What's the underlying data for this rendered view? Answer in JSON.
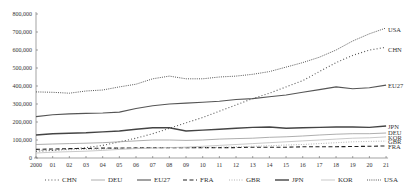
{
  "chart_data": {
    "type": "line",
    "title": "",
    "xlabel": "",
    "ylabel": "",
    "ylim": [
      0,
      800000
    ],
    "yticks": [
      0,
      100000,
      200000,
      300000,
      400000,
      500000,
      600000,
      700000,
      800000
    ],
    "ytick_labels": [
      "0",
      "100,000",
      "200,000",
      "300,000",
      "400,000",
      "500,000",
      "600,000",
      "700,000",
      "800,000"
    ],
    "x_tick_labels": [
      "2000",
      "01",
      "02",
      "03",
      "04",
      "05",
      "06",
      "07",
      "08",
      "09",
      "10",
      "11",
      "12",
      "13",
      "14",
      "15",
      "16",
      "17",
      "18",
      "19",
      "20",
      "21"
    ],
    "x": [
      2000,
      2001,
      2002,
      2003,
      2004,
      2005,
      2006,
      2007,
      2008,
      2009,
      2010,
      2011,
      2012,
      2013,
      2014,
      2015,
      2016,
      2017,
      2018,
      2019,
      2020,
      2021
    ],
    "grid": false,
    "legend_position": "bottom",
    "series": [
      {
        "name": "CHN",
        "style": "dotted",
        "color": "#555555",
        "values": [
          38000,
          42000,
          50000,
          58000,
          70000,
          90000,
          110000,
          135000,
          165000,
          195000,
          225000,
          260000,
          295000,
          330000,
          360000,
          395000,
          430000,
          480000,
          530000,
          570000,
          600000,
          615000
        ]
      },
      {
        "name": "DEU",
        "style": "solid-thin",
        "color": "#999999",
        "values": [
          75000,
          78000,
          80000,
          82000,
          85000,
          90000,
          95000,
          100000,
          100000,
          98000,
          100000,
          105000,
          108000,
          110000,
          115000,
          118000,
          122000,
          128000,
          132000,
          135000,
          135000,
          139000
        ]
      },
      {
        "name": "EU27",
        "style": "solid",
        "color": "#555555",
        "values": [
          230000,
          240000,
          245000,
          248000,
          250000,
          255000,
          275000,
          290000,
          300000,
          305000,
          310000,
          315000,
          325000,
          330000,
          340000,
          350000,
          365000,
          380000,
          395000,
          385000,
          390000,
          405000
        ]
      },
      {
        "name": "FRA",
        "style": "dashed",
        "color": "#222222",
        "values": [
          48000,
          50000,
          52000,
          53000,
          55000,
          55000,
          56000,
          58000,
          58000,
          57000,
          58000,
          58000,
          58000,
          60000,
          60000,
          60000,
          62000,
          62000,
          63000,
          64000,
          65000,
          67000
        ]
      },
      {
        "name": "GBR",
        "style": "dotted-light",
        "color": "#aaaaaa",
        "values": [
          42000,
          44000,
          46000,
          48000,
          50000,
          55000,
          55000,
          58000,
          58000,
          56000,
          58000,
          60000,
          62000,
          65000,
          68000,
          72000,
          75000,
          80000,
          85000,
          90000,
          92000,
          94000
        ]
      },
      {
        "name": "JPN",
        "style": "solid-thick",
        "color": "#444444",
        "values": [
          128000,
          135000,
          138000,
          140000,
          145000,
          150000,
          160000,
          168000,
          168000,
          150000,
          155000,
          160000,
          165000,
          170000,
          172000,
          165000,
          168000,
          170000,
          172000,
          172000,
          170000,
          178000
        ]
      },
      {
        "name": "KOR",
        "style": "solid-light",
        "color": "#bbbbbb",
        "values": [
          28000,
          32000,
          35000,
          38000,
          42000,
          48000,
          52000,
          55000,
          58000,
          60000,
          65000,
          70000,
          75000,
          80000,
          85000,
          90000,
          95000,
          100000,
          105000,
          110000,
          112000,
          117000
        ]
      },
      {
        "name": "USA",
        "style": "dash-dot-fine",
        "color": "#555555",
        "values": [
          367000,
          365000,
          360000,
          372000,
          378000,
          395000,
          410000,
          440000,
          455000,
          440000,
          440000,
          450000,
          455000,
          465000,
          480000,
          505000,
          530000,
          560000,
          600000,
          650000,
          690000,
          722000
        ]
      }
    ],
    "end_labels": [
      "USA",
      "CHN",
      "EU27",
      "JPN",
      "DEU",
      "KOR",
      "GBR",
      "FRA"
    ]
  }
}
